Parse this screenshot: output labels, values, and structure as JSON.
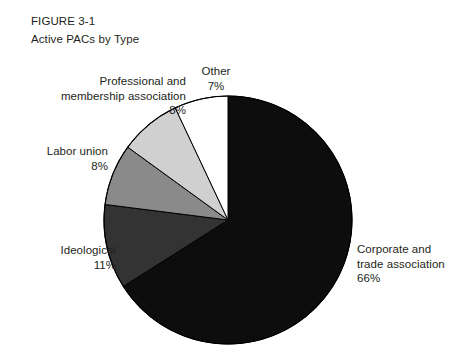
{
  "figure": {
    "number": "FIGURE 3-1",
    "title": "Active PACs by Type"
  },
  "colors": {
    "corporate": "#0d0d0d",
    "ideological": "#333333",
    "labor": "#8a8a8a",
    "professional": "#d0d0d0",
    "other": "#ffffff",
    "outline": "#000000",
    "text": "#231f20",
    "background": "#ffffff"
  },
  "labels": {
    "other": {
      "name": "Other",
      "value": "7%"
    },
    "professional": {
      "name_line1": "Professional and",
      "name_line2": "membership association",
      "value": "8%"
    },
    "labor": {
      "name": "Labor union",
      "value": "8%"
    },
    "ideological": {
      "name": "Ideological",
      "value": "11%"
    },
    "corporate": {
      "name_line1": "Corporate and",
      "name_line2": "trade association",
      "value": "66%"
    }
  },
  "chart_data": {
    "type": "pie",
    "title": "Active PACs by Type",
    "subtitle": "FIGURE 3-1",
    "categories": [
      "Corporate and trade association",
      "Ideological",
      "Labor union",
      "Professional and membership association",
      "Other"
    ],
    "values": [
      66,
      11,
      8,
      8,
      7
    ],
    "unit": "percent",
    "slice_colors": [
      "#0d0d0d",
      "#333333",
      "#8a8a8a",
      "#d0d0d0",
      "#ffffff"
    ],
    "start_angle_deg": 0,
    "direction": "clockwise-for-corporate-then-counterclockwise",
    "legend": "none",
    "labels_position": "outside-callout",
    "center": {
      "cx": 228,
      "cy": 220
    },
    "radius": 124,
    "grid": false
  }
}
